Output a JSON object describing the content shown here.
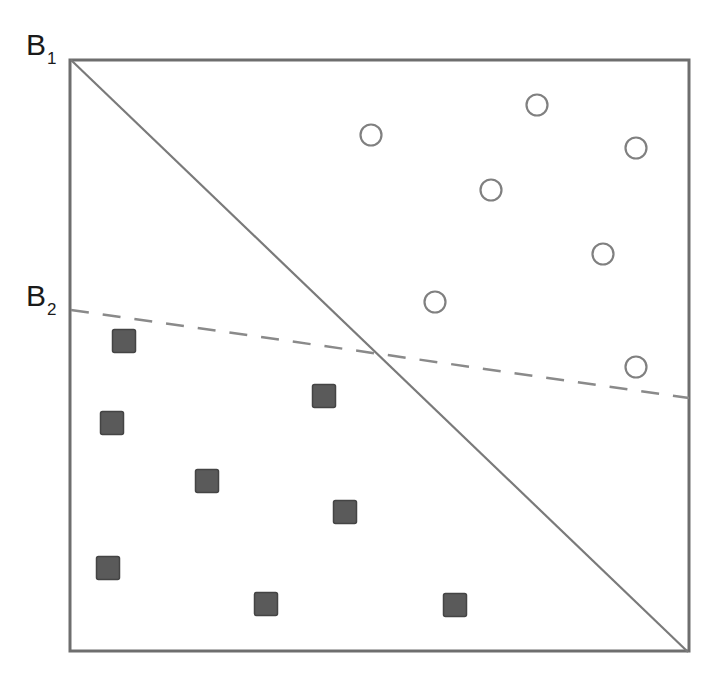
{
  "labels": {
    "b1": {
      "main": "B",
      "sub": "1"
    },
    "b2": {
      "main": "B",
      "sub": "2"
    }
  },
  "colors": {
    "frame": "#6e6e6e",
    "solid_line": "#7a7a7a",
    "dashed_line": "#8a8a8a",
    "circle_stroke": "#808080",
    "square_fill": "#5a5a5a",
    "square_stroke": "#444444"
  },
  "frame": {
    "x1": 70,
    "y1": 60,
    "x2": 689,
    "y2": 651
  },
  "boundaries": [
    {
      "name": "B1",
      "style": "solid",
      "from": [
        71,
        60
      ],
      "to": [
        688,
        652
      ]
    },
    {
      "name": "B2",
      "style": "dashed",
      "from": [
        71,
        310
      ],
      "to": [
        689,
        398
      ]
    }
  ],
  "circles": [
    {
      "cx": 371,
      "cy": 135
    },
    {
      "cx": 537,
      "cy": 105
    },
    {
      "cx": 636,
      "cy": 148
    },
    {
      "cx": 491,
      "cy": 190
    },
    {
      "cx": 603,
      "cy": 254
    },
    {
      "cx": 435,
      "cy": 302
    },
    {
      "cx": 636,
      "cy": 367
    }
  ],
  "squares": [
    {
      "cx": 124,
      "cy": 341
    },
    {
      "cx": 112,
      "cy": 423
    },
    {
      "cx": 324,
      "cy": 396
    },
    {
      "cx": 207,
      "cy": 481
    },
    {
      "cx": 345,
      "cy": 512
    },
    {
      "cx": 108,
      "cy": 568
    },
    {
      "cx": 266,
      "cy": 604
    },
    {
      "cx": 455,
      "cy": 605
    }
  ]
}
